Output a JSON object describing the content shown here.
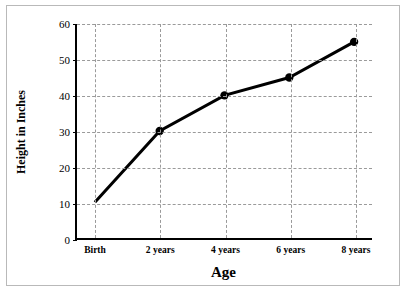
{
  "chart_data": {
    "type": "line",
    "title": "",
    "xlabel": "Age",
    "ylabel": "Height in Inches",
    "categories": [
      "Birth",
      "2 years",
      "4 years",
      "6 years",
      "8 years"
    ],
    "values": [
      10,
      30,
      40,
      45,
      55
    ],
    "ylim": [
      0,
      60
    ],
    "yticks": [
      0,
      10,
      20,
      30,
      40,
      50,
      60
    ],
    "ytick_labels": [
      "0",
      "10",
      "20",
      "30",
      "40",
      "50",
      "60"
    ],
    "grid": true,
    "legend": "none",
    "series_color": "#000000",
    "grid_color": "#9a9a9a",
    "axis_color": "#000000",
    "background": "#ffffff"
  }
}
